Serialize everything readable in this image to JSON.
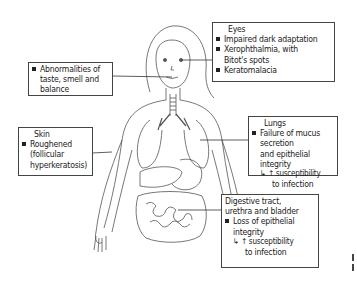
{
  "diagram": {
    "type": "anatomical-effects-diagram",
    "figure": "female-human-body-outline-with-internal-organs",
    "boxes": {
      "eyes": {
        "title": "Eyes",
        "items": [
          "Impaired dark adaptation",
          "Xerophthalmia, with",
          "Bitot's spots",
          "Keratomalacia"
        ]
      },
      "taste": {
        "items": [
          "Abnormalities of",
          "taste, smell and",
          "balance"
        ]
      },
      "skin": {
        "title": "Skin",
        "items": [
          "Roughened",
          "(follicular",
          "hyperkeratosis)"
        ]
      },
      "lungs": {
        "title": "Lungs",
        "items": [
          "Failure of mucus secretion",
          "and epithelial integrity"
        ],
        "arrow": "↳ ↑ susceptibility",
        "arrow_cont": "to infection"
      },
      "digestive": {
        "title_line1": "Digestive tract,",
        "title_line2": "urethra and bladder",
        "items": [
          "Loss of epithelial",
          "integrity"
        ],
        "arrow": "↳ ↑ susceptibility",
        "arrow_cont": "to infection"
      }
    },
    "colors": {
      "line": "#444444",
      "text": "#222222",
      "background": "#ffffff"
    }
  }
}
